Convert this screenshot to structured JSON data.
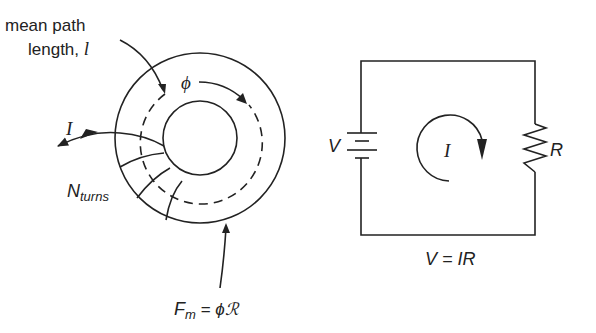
{
  "magnetic_circuit": {
    "mean_path_label_line1": "mean path",
    "mean_path_label_line2": "length, ",
    "mean_path_symbol": "l",
    "flux_symbol": "ϕ",
    "current_symbol": "I",
    "turns_label_main": "N",
    "turns_label_sub": "turns",
    "mmf_lhs_main": "F",
    "mmf_lhs_sub": "m",
    "mmf_rhs": " = ϕℛ"
  },
  "electric_circuit": {
    "voltage_label": "V",
    "resistance_label": "R",
    "current_symbol": "I",
    "ohms_law_lhs": "V = ",
    "ohms_law_rhs": "IR"
  }
}
